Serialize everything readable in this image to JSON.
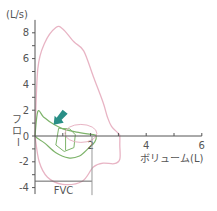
{
  "chart_data": {
    "type": "line",
    "title": "",
    "xlabel": "ボリューム(L)",
    "ylabel": "フロー",
    "yunit": "(L/s)",
    "xlim": [
      0,
      6
    ],
    "ylim": [
      -4.5,
      9
    ],
    "x_ticks": [
      {
        "value": 1,
        "label": ""
      },
      {
        "value": 2,
        "label": "2"
      },
      {
        "value": 3,
        "label": ""
      },
      {
        "value": 4,
        "label": "4"
      },
      {
        "value": 5,
        "label": ""
      },
      {
        "value": 6,
        "label": "6"
      }
    ],
    "y_ticks": [
      {
        "value": 8,
        "label": "8"
      },
      {
        "value": 7,
        "label": ""
      },
      {
        "value": 6,
        "label": "6"
      },
      {
        "value": 5,
        "label": ""
      },
      {
        "value": 4,
        "label": "4"
      },
      {
        "value": 3,
        "label": ""
      },
      {
        "value": 2,
        "label": "2"
      },
      {
        "value": 1,
        "label": ""
      },
      {
        "value": 0,
        "label": "0"
      },
      {
        "value": -1,
        "label": ""
      },
      {
        "value": -2,
        "label": "-2"
      },
      {
        "value": -3,
        "label": ""
      },
      {
        "value": -4,
        "label": "-4"
      }
    ],
    "grid": false,
    "series": [
      {
        "name": "predicted normal flow-volume loop",
        "color": "#e8b4c4",
        "points": [
          [
            0,
            0
          ],
          [
            0.1,
            5.2
          ],
          [
            0.35,
            7.2
          ],
          [
            0.75,
            8.4
          ],
          [
            1.0,
            8.3
          ],
          [
            1.4,
            7.3
          ],
          [
            1.75,
            6.6
          ],
          [
            2.1,
            4.6
          ],
          [
            2.45,
            2.6
          ],
          [
            2.6,
            1.5
          ],
          [
            2.75,
            0.75
          ],
          [
            3.0,
            0.2
          ],
          [
            3.05,
            0
          ],
          [
            3.05,
            -0.7
          ],
          [
            3.05,
            -1.8
          ],
          [
            2.85,
            -2.15
          ],
          [
            2.45,
            -2.1
          ],
          [
            2.1,
            -2.4
          ],
          [
            1.7,
            -3.5
          ],
          [
            1.0,
            -3.75
          ],
          [
            0.45,
            -3.2
          ],
          [
            0.15,
            -2.0
          ],
          [
            0,
            0
          ]
        ]
      },
      {
        "name": "measured flow-volume loop (obstructive)",
        "color": "#7db36a",
        "points": [
          [
            0,
            0
          ],
          [
            0.1,
            1.9
          ],
          [
            0.3,
            1.5
          ],
          [
            0.6,
            1.0
          ],
          [
            1.0,
            0.55
          ],
          [
            1.5,
            0.3
          ],
          [
            2.1,
            0.1
          ],
          [
            2.2,
            0
          ],
          [
            2.15,
            -0.45
          ],
          [
            1.9,
            -1.0
          ],
          [
            1.6,
            -1.55
          ],
          [
            1.2,
            -1.7
          ],
          [
            0.75,
            -1.3
          ],
          [
            0.35,
            -0.55
          ],
          [
            0.1,
            -0.2
          ],
          [
            0,
            0
          ]
        ]
      }
    ],
    "annotations": [
      {
        "type": "arrow",
        "color": "#2a8f87",
        "x": 0.85,
        "y": 1.1,
        "direction": "down-left"
      },
      {
        "type": "bracket",
        "label": "FVC",
        "from": 0,
        "to": 2.05,
        "y": -3.5
      }
    ]
  }
}
